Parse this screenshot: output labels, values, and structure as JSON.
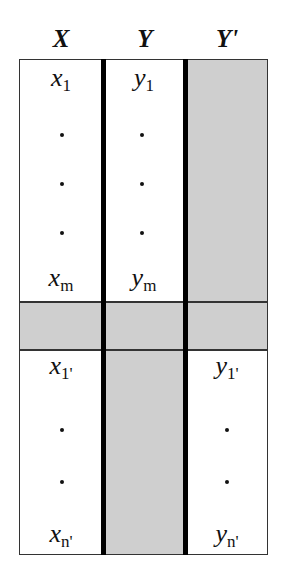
{
  "headers": [
    "X",
    "Y",
    "Y'"
  ],
  "top_block": {
    "col_x": {
      "first": {
        "var": "x",
        "sub": "1"
      },
      "last": {
        "var": "x",
        "sub": "m"
      }
    },
    "col_y": {
      "first": {
        "var": "y",
        "sub": "1"
      },
      "last": {
        "var": "y",
        "sub": "m"
      }
    },
    "col_yprime": "shaded (missing)",
    "ellipsis_dots": 3
  },
  "separator_band": "shaded (missing row)",
  "bottom_block": {
    "col_x": {
      "first": {
        "var": "x",
        "sub": "1'"
      },
      "last": {
        "var": "x",
        "sub": "n'"
      }
    },
    "col_y": "shaded (missing)",
    "col_yprime": {
      "first": {
        "var": "y",
        "sub": "1'"
      },
      "last": {
        "var": "y",
        "sub": "n'"
      }
    },
    "ellipsis_dots": 2
  },
  "colors": {
    "shade": "#cfcfcf",
    "border": "#333333",
    "divider": "#000000"
  }
}
